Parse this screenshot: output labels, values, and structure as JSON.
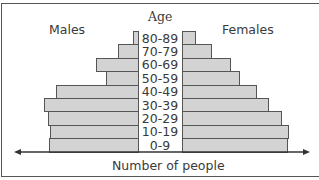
{
  "chart_data": {
    "type": "bar",
    "subtype": "population-pyramid",
    "title": "",
    "center_label": "Age",
    "xlabel": "Number of people",
    "left_label": "Males",
    "right_label": "Females",
    "categories": [
      "80-89",
      "70-79",
      "60-69",
      "50-59",
      "40-49",
      "30-39",
      "20-29",
      "10-19",
      "0-9"
    ],
    "series": [
      {
        "name": "Males",
        "values": [
          5,
          20,
          42,
          32,
          82,
          94,
          90,
          88,
          89
        ]
      },
      {
        "name": "Females",
        "values": [
          14,
          30,
          49,
          58,
          75,
          87,
          100,
          107,
          106
        ]
      }
    ],
    "units": "relative (pixel-estimated, no numeric axis shown)",
    "grid": false,
    "legend": "side labels"
  }
}
